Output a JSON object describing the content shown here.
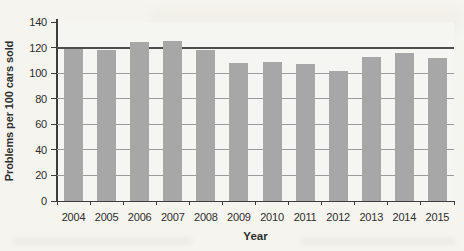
{
  "chart_data": {
    "type": "bar",
    "title": "",
    "xlabel": "Year",
    "ylabel": "Problems per 100 cars sold",
    "categories": [
      "2004",
      "2005",
      "2006",
      "2007",
      "2008",
      "2009",
      "2010",
      "2011",
      "2012",
      "2013",
      "2014",
      "2015"
    ],
    "values": [
      119,
      118,
      124,
      125,
      118,
      108,
      109,
      107,
      102,
      113,
      116,
      112
    ],
    "ylim": [
      0,
      140
    ],
    "yticks": [
      0,
      20,
      40,
      60,
      80,
      100,
      120,
      140
    ],
    "grid": "horizontal",
    "reference_line_y": 120,
    "legend_position": "none",
    "colors": {
      "bar": "#a7a7a7",
      "gridline": "#9b9b9b",
      "reference_line": "#4d4d4d",
      "axis": "#3c3c3c",
      "text": "#2e2e2e",
      "plot_background": "#f5f5f2",
      "page_background": "#f6f4ee"
    }
  }
}
